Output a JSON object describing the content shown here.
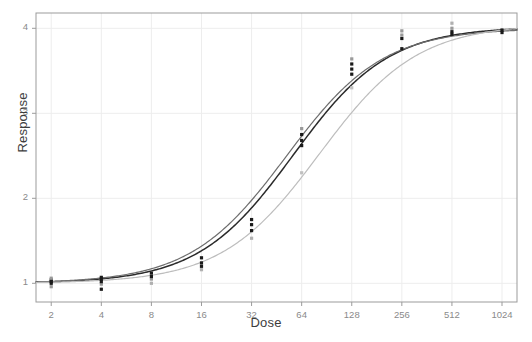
{
  "chart_data": {
    "type": "line",
    "title": "",
    "xlabel": "Dose",
    "ylabel": "Response",
    "xscale": "log2",
    "xlim": [
      1.62,
      1260
    ],
    "ylim": [
      0.78,
      4.18
    ],
    "grid": true,
    "legend_position": "none",
    "x_ticks": [
      2,
      4,
      8,
      16,
      32,
      64,
      128,
      256,
      512,
      1024
    ],
    "x_tick_labels": [
      "2",
      "4",
      "8",
      "16",
      "32",
      "64",
      "128",
      "256",
      "512",
      "1024"
    ],
    "y_ticks": [
      1,
      2,
      3,
      4
    ],
    "y_tick_labels": [
      "1",
      "2",
      "3",
      "4"
    ],
    "series": [
      {
        "name": "fit-dark",
        "color": "#2b2b2b",
        "style": "solid",
        "width": 1.5,
        "model": "4-parameter logistic",
        "params": {
          "bottom": 1.0,
          "top": 4.02,
          "ec50": 57.0,
          "hill": 1.52
        },
        "x": [
          2,
          2.8,
          4,
          5.7,
          8,
          11.3,
          16,
          22.6,
          32,
          45.3,
          64,
          90.5,
          128,
          181,
          256,
          362,
          512,
          724,
          1024
        ],
        "y": [
          1.01,
          1.02,
          1.03,
          1.05,
          1.09,
          1.15,
          1.26,
          1.43,
          1.69,
          2.05,
          2.49,
          2.93,
          3.31,
          3.59,
          3.78,
          3.89,
          3.95,
          3.98,
          4.0
        ]
      },
      {
        "name": "fit-gray",
        "color": "#6e6e6e",
        "style": "solid",
        "width": 1.2,
        "model": "4-parameter logistic",
        "params": {
          "bottom": 1.0,
          "top": 4.0,
          "ec50": 52.0,
          "hill": 1.5
        },
        "x": [
          2,
          2.8,
          4,
          5.7,
          8,
          11.3,
          16,
          22.6,
          32,
          45.3,
          64,
          90.5,
          128,
          181,
          256,
          362,
          512,
          724,
          1024
        ],
        "y": [
          1.01,
          1.02,
          1.04,
          1.06,
          1.11,
          1.18,
          1.31,
          1.5,
          1.78,
          2.16,
          2.6,
          3.03,
          3.39,
          3.65,
          3.81,
          3.91,
          3.96,
          3.98,
          4.0
        ]
      },
      {
        "name": "fit-light",
        "color": "#bdbdbd",
        "style": "solid",
        "width": 1.2,
        "model": "4-parameter logistic",
        "params": {
          "bottom": 1.0,
          "top": 4.05,
          "ec50": 82.0,
          "hill": 1.48
        },
        "x": [
          2,
          2.8,
          4,
          5.7,
          8,
          11.3,
          16,
          22.6,
          32,
          45.3,
          64,
          90.5,
          128,
          181,
          256,
          362,
          512,
          724,
          1024
        ],
        "y": [
          1.0,
          1.01,
          1.02,
          1.03,
          1.06,
          1.1,
          1.17,
          1.29,
          1.47,
          1.76,
          2.13,
          2.56,
          2.99,
          3.38,
          3.66,
          3.84,
          3.94,
          3.99,
          4.02
        ]
      }
    ],
    "points": [
      {
        "dose": 2,
        "values": [
          0.96,
          1.0,
          1.02,
          1.04,
          1.06
        ],
        "shades": [
          "#9a9a9a",
          "#1a1a1a",
          "#1a1a1a",
          "#1a1a1a",
          "#9a9a9a"
        ]
      },
      {
        "dose": 4,
        "values": [
          0.93,
          0.99,
          1.02,
          1.05,
          1.07
        ],
        "shades": [
          "#1a1a1a",
          "#9a9a9a",
          "#1a1a1a",
          "#1a1a1a",
          "#1a1a1a"
        ]
      },
      {
        "dose": 8,
        "values": [
          1.0,
          1.05,
          1.08,
          1.12
        ],
        "shades": [
          "#b0b0b0",
          "#9a9a9a",
          "#1a1a1a",
          "#1a1a1a"
        ]
      },
      {
        "dose": 16,
        "values": [
          1.16,
          1.2,
          1.24,
          1.3
        ],
        "shades": [
          "#b0b0b0",
          "#1a1a1a",
          "#1a1a1a",
          "#1a1a1a"
        ]
      },
      {
        "dose": 32,
        "values": [
          1.53,
          1.62,
          1.69,
          1.75
        ],
        "shades": [
          "#b0b0b0",
          "#1a1a1a",
          "#1a1a1a",
          "#1a1a1a"
        ]
      },
      {
        "dose": 64,
        "values": [
          2.3,
          2.62,
          2.68,
          2.75,
          2.82
        ],
        "shades": [
          "#c0c0c0",
          "#1a1a1a",
          "#1a1a1a",
          "#1a1a1a",
          "#9a9a9a"
        ]
      },
      {
        "dose": 128,
        "values": [
          3.3,
          3.46,
          3.52,
          3.58,
          3.64
        ],
        "shades": [
          "#c0c0c0",
          "#1a1a1a",
          "#1a1a1a",
          "#1a1a1a",
          "#9a9a9a"
        ]
      },
      {
        "dose": 256,
        "values": [
          3.76,
          3.88,
          3.92,
          3.97
        ],
        "shades": [
          "#1a1a1a",
          "#1a1a1a",
          "#9a9a9a",
          "#9a9a9a"
        ]
      },
      {
        "dose": 512,
        "values": [
          3.93,
          3.96,
          4.0,
          4.06
        ],
        "shades": [
          "#1a1a1a",
          "#1a1a1a",
          "#9a9a9a",
          "#b0b0b0"
        ]
      },
      {
        "dose": 1024,
        "values": [
          3.95,
          3.98
        ],
        "shades": [
          "#1a1a1a",
          "#1a1a1a"
        ]
      }
    ],
    "colors": {
      "background": "#ffffff",
      "grid": "#ededed",
      "frame": "#9b9b9b",
      "tick_label": "#8a8a8a",
      "axis_title": "#3d3d3d"
    }
  }
}
